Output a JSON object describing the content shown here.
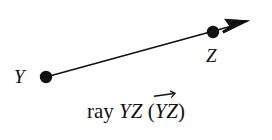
{
  "figure": {
    "title": "ray YZ",
    "background_color": "#ffffff",
    "ink_color": "#111111",
    "width": 272,
    "height": 140
  },
  "diagram": {
    "type": "geometry-ray",
    "points": [
      {
        "id": "Y",
        "label": "Y",
        "x": 46,
        "y": 77,
        "style": "filled-dot",
        "dot_radius": 6,
        "label_x": 22,
        "label_y": 81
      },
      {
        "id": "Z",
        "label": "Z",
        "x": 213,
        "y": 32,
        "style": "filled-dot",
        "dot_radius": 6,
        "label_x": 214,
        "label_y": 60
      }
    ],
    "ray": {
      "from": "Y",
      "to": "Z",
      "start_x": 46,
      "start_y": 77,
      "end_x": 250,
      "end_y": 21,
      "line_width": 1.6,
      "arrow_at": "end",
      "arrowhead_style": "solid-triangle",
      "arrowhead_length": 26,
      "arrowhead_width": 15,
      "color": "#111111"
    }
  },
  "caption": {
    "full_text": "ray YZ (YZ)",
    "prefix": "ray ",
    "name_plain": "YZ",
    "open_paren": " (",
    "name_vector": "YZ",
    "close_paren": ")",
    "vector_notation": "overarrow",
    "arrow_direction": "right"
  }
}
